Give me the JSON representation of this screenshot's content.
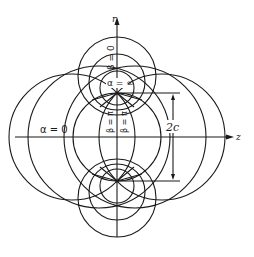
{
  "figure": {
    "axes": {
      "vertical_label": "r",
      "horizontal_label": "z"
    },
    "labels": {
      "alpha_infinity": "α = ∞",
      "alpha_zero": "α = 0",
      "beta_zero": "β = 0",
      "beta_pi_left": "β = π",
      "beta_pi_right": "β = π",
      "focal_distance": "2c"
    }
  }
}
